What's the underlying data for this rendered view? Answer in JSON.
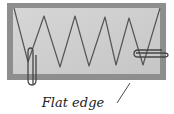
{
  "figure": {
    "label": "Flat edge",
    "colors": {
      "board_border": "#8e8e8e",
      "board_inner": "#cfcfcf",
      "wire": "#555555",
      "clip": "#444444",
      "text": "#222222"
    },
    "board": {
      "outer": [
        7,
        3,
        159,
        77
      ],
      "inner": [
        13,
        8,
        147,
        66
      ]
    },
    "wave_points": [
      [
        14,
        8
      ],
      [
        28,
        62
      ],
      [
        44,
        16
      ],
      [
        60,
        67
      ],
      [
        75,
        16
      ],
      [
        89,
        66
      ],
      [
        105,
        17
      ],
      [
        116,
        65
      ],
      [
        129,
        18
      ],
      [
        143,
        65
      ],
      [
        160,
        8
      ]
    ],
    "clips": [
      {
        "name": "left-paper-clip",
        "orientation": "vertical",
        "x": 29,
        "y": 48,
        "w": 7,
        "h": 37
      },
      {
        "name": "right-paper-clip",
        "orientation": "horizontal",
        "x": 134,
        "y": 50,
        "w": 34,
        "h": 7
      }
    ],
    "leader_line": [
      [
        130,
        83
      ],
      [
        117,
        103
      ]
    ]
  }
}
